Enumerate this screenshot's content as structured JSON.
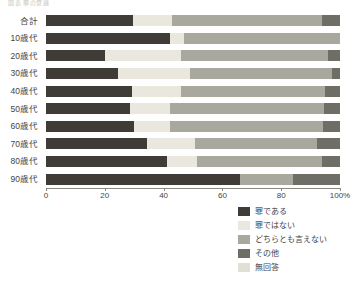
{
  "header": {
    "cutoff_text": "図表  罪の意識"
  },
  "chart_data": {
    "type": "bar",
    "orientation": "horizontal",
    "stacked": true,
    "percent": true,
    "title": "",
    "xlabel": "",
    "ylabel": "",
    "xlim": [
      0,
      100
    ],
    "xticks": [
      0,
      20,
      40,
      60,
      80,
      100
    ],
    "xticklabels": [
      "0",
      "20",
      "40",
      "60",
      "80",
      "100%"
    ],
    "grid": false,
    "legend_position": "bottom-right",
    "categories": [
      "合計",
      "10歳代",
      "20歳代",
      "30歳代",
      "40歳代",
      "50歳代",
      "60歳代",
      "70歳代",
      "80歳代",
      "90歳代"
    ],
    "series": [
      {
        "name": "罪である",
        "color": "#3f3c37",
        "values": [
          29.6,
          42.2,
          20.0,
          24.5,
          29.2,
          28.6,
          29.9,
          34.5,
          41.2,
          66.0
        ]
      },
      {
        "name": "罪ではない",
        "color": "#eae8de",
        "values": [
          13.3,
          4.8,
          26.0,
          24.5,
          16.7,
          13.6,
          12.2,
          16.3,
          10.3,
          0.0
        ]
      },
      {
        "name": "どちらとも言えない",
        "color": "#a9a89e",
        "values": [
          51.0,
          53.0,
          50.0,
          48.3,
          49.0,
          52.4,
          52.0,
          41.5,
          42.3,
          18.0
        ]
      },
      {
        "name": "その他",
        "color": "#6f6e66",
        "values": [
          6.1,
          0.0,
          4.0,
          2.7,
          5.1,
          5.4,
          5.9,
          7.7,
          6.2,
          16.0
        ]
      },
      {
        "name": "無回答",
        "color": "#e2e0d4",
        "values": [
          0.0,
          0.0,
          0.0,
          0.0,
          0.0,
          0.0,
          0.0,
          0.0,
          0.0,
          0.0
        ]
      }
    ]
  }
}
